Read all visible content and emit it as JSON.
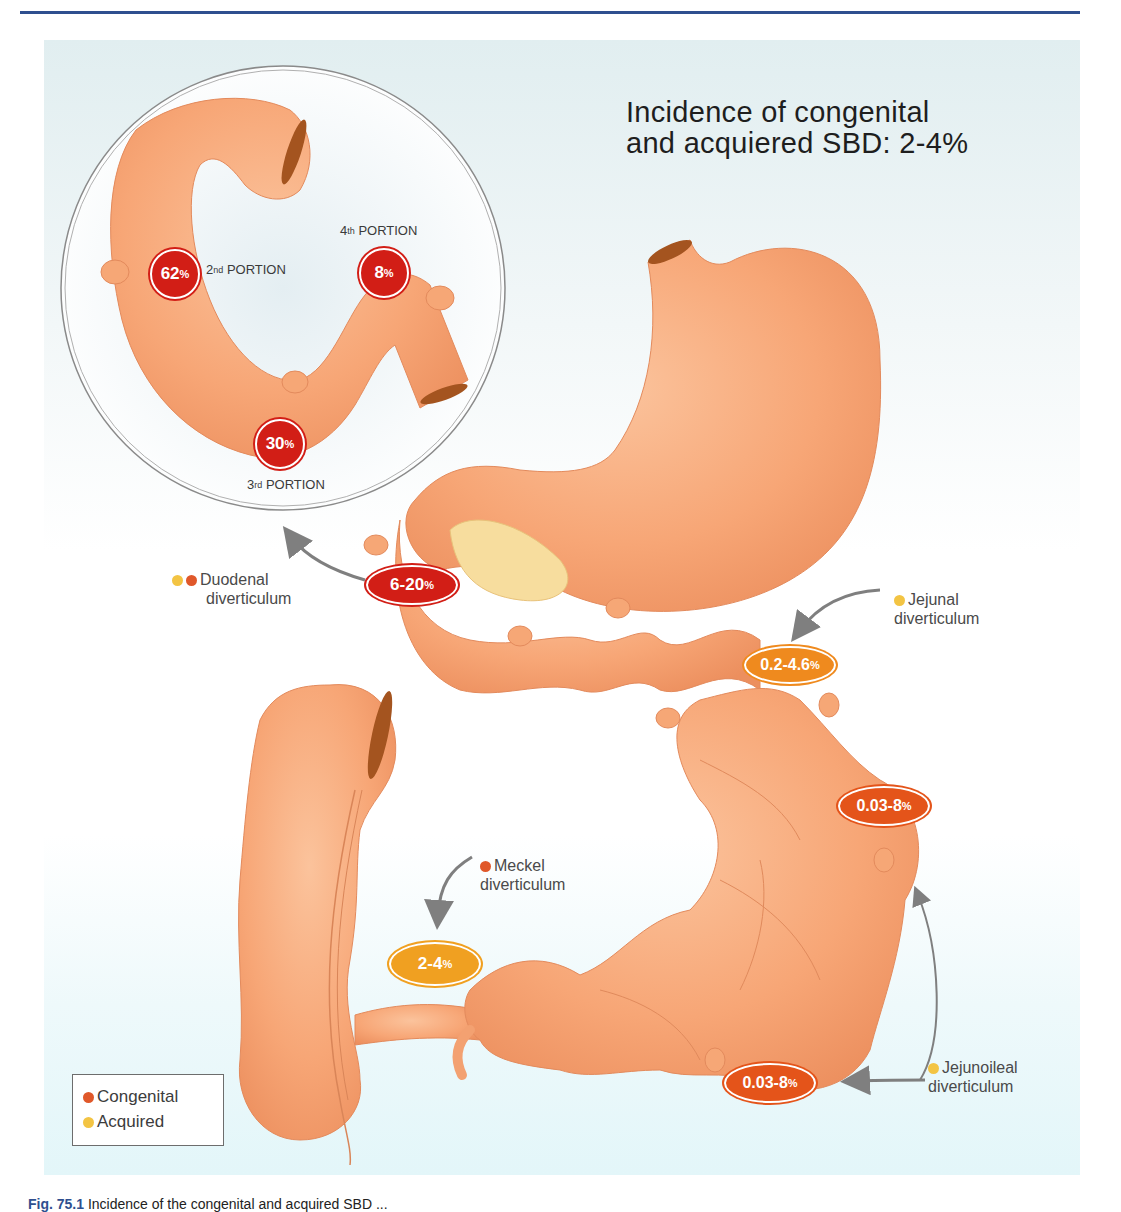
{
  "figure": {
    "title_line1": "Incidence of congenital",
    "title_line2": "and acquiered SBD: 2-4%",
    "caption_label": "Fig. 75.1",
    "caption_text": "Incidence of the congenital and acquired SBD ..."
  },
  "inset": {
    "portions": [
      {
        "ordinal": "2",
        "suffix": "nd",
        "label": "PORTION",
        "value": "62",
        "unit": "%"
      },
      {
        "ordinal": "3",
        "suffix": "rd",
        "label": "PORTION",
        "value": "30",
        "unit": "%"
      },
      {
        "ordinal": "4",
        "suffix": "th",
        "label": "PORTION",
        "value": "8",
        "unit": "%"
      }
    ]
  },
  "callouts": {
    "duodenal": {
      "line1": "Duodenal",
      "line2": "diverticulum",
      "value": "6-20",
      "unit": "%",
      "types": [
        "acquired",
        "congenital"
      ]
    },
    "jejunal": {
      "line1": "Jejunal",
      "line2": "diverticulum",
      "value": "0.2-4.6",
      "unit": "%",
      "types": [
        "acquired"
      ]
    },
    "jejunoileal_upper": {
      "value": "0.03-8",
      "unit": "%"
    },
    "jejunoileal": {
      "line1": "Jejunoileal",
      "line2": "diverticulum",
      "value": "0.03-8",
      "unit": "%",
      "types": [
        "acquired"
      ]
    },
    "meckel": {
      "line1": "Meckel",
      "line2": "diverticulum",
      "value": "2-4",
      "unit": "%",
      "types": [
        "congenital"
      ]
    }
  },
  "legend": {
    "items": [
      {
        "label": "Congenital",
        "color": "#e0582a"
      },
      {
        "label": "Acquired",
        "color": "#f3c443"
      }
    ]
  },
  "colors": {
    "organ": "#f8a878",
    "organ_dark": "#e98a5a",
    "lumen": "#a4541f",
    "badge_red": "#d21e16",
    "badge_orange_red": "#e4541a",
    "badge_orange": "#ef8a1e",
    "badge_yellow_orange": "#f0a021",
    "rule": "#2f4f8f",
    "arrow": "#7f7f7f"
  }
}
